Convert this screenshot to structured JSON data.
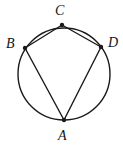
{
  "figure": {
    "type": "euclidean-geometry-diagram",
    "canvas": {
      "width": 123,
      "height": 148,
      "background": "#ffffff"
    },
    "stroke_color": "#1a1a1a",
    "stroke_width": 1.4,
    "circle": {
      "name": "circumscribed-circle",
      "center_x": 64,
      "center_y": 74,
      "radius": 46
    },
    "vertices": [
      {
        "id": "A",
        "label": "A",
        "x": 64,
        "y": 120,
        "label_x": 58,
        "label_y": 129
      },
      {
        "id": "B",
        "label": "B",
        "x": 25,
        "y": 48,
        "label_x": 6,
        "label_y": 37
      },
      {
        "id": "C",
        "label": "C",
        "x": 62,
        "y": 25,
        "label_x": 55,
        "label_y": 4
      },
      {
        "id": "D",
        "label": "D",
        "x": 101,
        "y": 47,
        "label_x": 108,
        "label_y": 36
      }
    ],
    "vertex_dot_radius": 2.2,
    "chords": [
      {
        "name": "segment-AB",
        "from": "A",
        "to": "B"
      },
      {
        "name": "segment-BC",
        "from": "B",
        "to": "C"
      },
      {
        "name": "segment-CD",
        "from": "C",
        "to": "D"
      },
      {
        "name": "segment-DA",
        "from": "D",
        "to": "A"
      }
    ]
  }
}
